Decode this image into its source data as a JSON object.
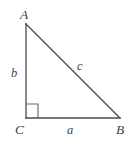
{
  "figure": {
    "kind": "right-triangle-diagram",
    "width": 131,
    "height": 142,
    "background_color": "#ffffff",
    "stroke_color": "#4a4a52",
    "label_color": "#3f3f46",
    "stroke_width": 1.3,
    "vertices": [
      {
        "name": "A",
        "label": "A",
        "x": 26,
        "y": 24
      },
      {
        "name": "B",
        "label": "B",
        "x": 120,
        "y": 118
      },
      {
        "name": "C",
        "label": "C",
        "x": 26,
        "y": 118
      }
    ],
    "sides": [
      {
        "name": "a",
        "label": "a",
        "from": "C",
        "to": "B",
        "role": "adjacent-leg"
      },
      {
        "name": "b",
        "label": "b",
        "from": "C",
        "to": "A",
        "role": "opposite-leg"
      },
      {
        "name": "c",
        "label": "c",
        "from": "A",
        "to": "B",
        "role": "hypotenuse"
      }
    ],
    "right_angle": {
      "at_vertex": "C",
      "marker": "square",
      "size": 14
    },
    "paths": {
      "leg_b": "M 26 24 L 26 118",
      "leg_a": "M 26 118 L 120 118",
      "hypotenuse_c": "M 26 24 L 120 118",
      "right_angle_square": "M 26 104 L 38 104 L 38 118"
    }
  }
}
